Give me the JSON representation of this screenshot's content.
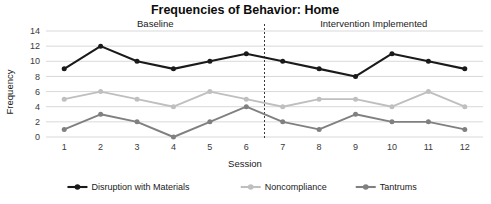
{
  "chart_data": {
    "type": "line",
    "title": "Frequencies of Behavior: Home",
    "xlabel": "Session",
    "ylabel": "Frequency",
    "x": [
      1,
      2,
      3,
      4,
      5,
      6,
      7,
      8,
      9,
      10,
      11,
      12
    ],
    "categories": [
      "1",
      "2",
      "3",
      "4",
      "5",
      "6",
      "7",
      "8",
      "9",
      "10",
      "11",
      "12"
    ],
    "xlim": [
      0.5,
      12.5
    ],
    "ylim": [
      0,
      14
    ],
    "yticks": [
      0,
      2,
      4,
      6,
      8,
      10,
      12,
      14
    ],
    "ytick_labels": [
      "0",
      "2",
      "4",
      "6",
      "8",
      "10",
      "12",
      "14"
    ],
    "grid": "horizontal",
    "legend_position": "bottom",
    "series": [
      {
        "name": "Disruption with Materials",
        "color": "#1a1a1a",
        "values": [
          9,
          12,
          10,
          9,
          10,
          11,
          10,
          9,
          8,
          11,
          10,
          9
        ]
      },
      {
        "name": "Noncompliance",
        "color": "#bfbfbf",
        "values": [
          5,
          6,
          5,
          4,
          6,
          5,
          4,
          5,
          5,
          4,
          6,
          4
        ]
      },
      {
        "name": "Tantrums",
        "color": "#808080",
        "values": [
          1,
          3,
          2,
          0,
          2,
          4,
          2,
          1,
          3,
          2,
          2,
          1
        ]
      }
    ],
    "phases": [
      {
        "label": "Baseline",
        "start": 1,
        "end": 6
      },
      {
        "label": "Intervention Implemented",
        "start": 7,
        "end": 12
      }
    ],
    "phase_change_line": {
      "between": [
        6,
        7
      ],
      "style": "dashed"
    }
  },
  "legend": {
    "items": [
      {
        "label": "Disruption with Materials",
        "color": "#1a1a1a"
      },
      {
        "label": "Noncompliance",
        "color": "#bfbfbf"
      },
      {
        "label": "Tantrums",
        "color": "#808080"
      }
    ]
  }
}
